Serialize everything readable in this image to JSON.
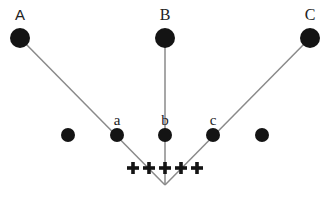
{
  "diagram": {
    "convergence_point": {
      "x": 165,
      "y": 185
    },
    "line_color": "#8a8a8a",
    "dot_color": "#141414",
    "top_nodes": [
      {
        "label": "A",
        "x": 20,
        "y": 38,
        "r": 10
      },
      {
        "label": "B",
        "x": 165,
        "y": 38,
        "r": 10
      },
      {
        "label": "C",
        "x": 310,
        "y": 38,
        "r": 10
      }
    ],
    "middle_nodes": [
      {
        "label": "",
        "x": 68,
        "y": 135,
        "r": 7
      },
      {
        "label": "a",
        "x": 117,
        "y": 135,
        "r": 7
      },
      {
        "label": "b",
        "x": 165,
        "y": 135,
        "r": 7
      },
      {
        "label": "c",
        "x": 213,
        "y": 135,
        "r": 7
      },
      {
        "label": "",
        "x": 262,
        "y": 135,
        "r": 7
      }
    ],
    "plus_signs": [
      {
        "symbol": "+",
        "x": 133,
        "y": 168
      },
      {
        "symbol": "+",
        "x": 149,
        "y": 168
      },
      {
        "symbol": "+",
        "x": 165,
        "y": 168
      },
      {
        "symbol": "+",
        "x": 181,
        "y": 168
      },
      {
        "symbol": "+",
        "x": 197,
        "y": 168
      }
    ]
  }
}
